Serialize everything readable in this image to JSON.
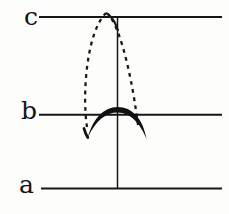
{
  "figure": {
    "colors": {
      "ink": "#161616",
      "background": "#fdfdfc"
    },
    "labels": [
      {
        "id": "c",
        "text": "c"
      },
      {
        "id": "b",
        "text": "b"
      },
      {
        "id": "a",
        "text": "a"
      }
    ],
    "geometry": {
      "line_c": "M 39 17 H 222",
      "line_b": "M 39 114.8 H 222",
      "line_a": "M 41 188.5 H 222",
      "vertical_axis": "M 117.5 16 V 189",
      "dashed_left_branch": "M 87 127 C 82 95 86.5 32 106 13",
      "dashed_right_branch": "M 106 13 C 116 17 130 62 138 125",
      "solid_peak_segment": "M 108.5 14.5 C 113 18.5 115.8 23.5 117.8 30",
      "bold_arc": "M 87.8 137.6 C 93 118 104.5 107 117.5 107 C 132 107 143 118.5 146.5 139 C 140.5 124.5 131 112.6 117.5 112.6 C 106 112.6 95.8 120.5 87.8 137.6 Z",
      "bold_arc_left_hook": "M 84 128.5 C 84.8 131.6 86 134.8 87.8 137.6"
    }
  }
}
